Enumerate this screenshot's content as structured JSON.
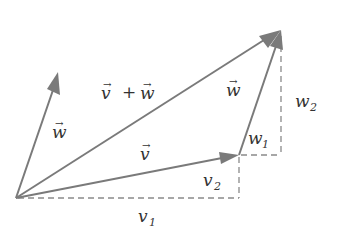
{
  "diagram": {
    "colors": {
      "vector": "#7a7a7a",
      "dashed": "#8a8a8a",
      "text": "#333333",
      "background": "#ffffff"
    },
    "points": {
      "origin": [
        16,
        198
      ],
      "v_tip": [
        239,
        155
      ],
      "sum_tip": [
        280,
        30
      ],
      "w_tip_from_origin": [
        58,
        72
      ]
    },
    "labels": {
      "w_from_origin": "w",
      "sum": "v + w",
      "w_translated": "w",
      "v": "v",
      "w1": "w",
      "w1_sub": "1",
      "w2": "w",
      "w2_sub": "2",
      "v1": "v",
      "v1_sub": "1",
      "v2": "v",
      "v2_sub": "2",
      "arrow_mark": "→"
    }
  }
}
